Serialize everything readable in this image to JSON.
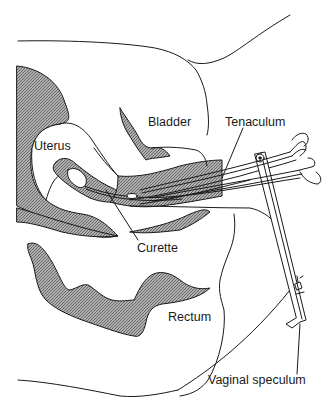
{
  "diagram": {
    "labels": {
      "bladder": "Bladder",
      "tenaculum": "Tenaculum",
      "uterus": "Uterus",
      "curette": "Curette",
      "rectum": "Rectum",
      "vaginal_speculum": "Vaginal speculum"
    },
    "colors": {
      "line": "#1a1a1a",
      "tissue_hatch": "#8a8a8a",
      "background": "#ffffff"
    }
  }
}
